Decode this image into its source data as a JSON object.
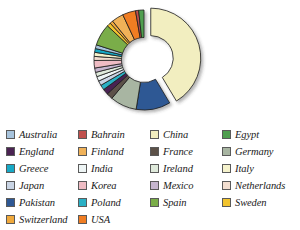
{
  "chart": {
    "title": "",
    "type_label": "exploded-donut"
  },
  "legend": {
    "columns": 4,
    "items": [
      {
        "label": "Australia",
        "color": "#a8c4dd"
      },
      {
        "label": "Bahrain",
        "color": "#c0504d"
      },
      {
        "label": "China",
        "color": "#f2eec0"
      },
      {
        "label": "Egypt",
        "color": "#4f9e4f"
      },
      {
        "label": "England",
        "color": "#4a2352"
      },
      {
        "label": "Finland",
        "color": "#f0b259"
      },
      {
        "label": "France",
        "color": "#5c5148"
      },
      {
        "label": "Germany",
        "color": "#a8b5a2"
      },
      {
        "label": "Greece",
        "color": "#17a9c6"
      },
      {
        "label": "India",
        "color": "#eef5f5"
      },
      {
        "label": "Ireland",
        "color": "#dfeadb"
      },
      {
        "label": "Italy",
        "color": "#f5f2cc"
      },
      {
        "label": "Japan",
        "color": "#c9d4e4"
      },
      {
        "label": "Korea",
        "color": "#efbcc4"
      },
      {
        "label": "Mexico",
        "color": "#c6b6cf"
      },
      {
        "label": "Netherlands",
        "color": "#f2ded0"
      },
      {
        "label": "Pakistan",
        "color": "#2e5894"
      },
      {
        "label": "Poland",
        "color": "#2ab0c5"
      },
      {
        "label": "Spain",
        "color": "#7aad48"
      },
      {
        "label": "Sweden",
        "color": "#f2c42e"
      },
      {
        "label": "Switzerland",
        "color": "#f0a93c"
      },
      {
        "label": "USA",
        "color": "#f07d23"
      }
    ]
  },
  "chart_data": {
    "type": "pie",
    "title": "",
    "xlabel": "",
    "ylabel": "",
    "legend_position": "bottom",
    "grid": false,
    "exploded_slice": "China",
    "start_angle_deg": 0,
    "donut_hole_ratio": 0.45,
    "categories": [
      "China",
      "Pakistan",
      "Germany",
      "France",
      "England",
      "Poland",
      "Japan",
      "India",
      "Ireland",
      "Mexico",
      "Korea",
      "Netherlands",
      "Italy",
      "Greece",
      "Australia",
      "Spain",
      "Sweden",
      "Switzerland",
      "Finland",
      "USA",
      "Bahrain",
      "Egypt"
    ],
    "values": [
      41.0,
      11.0,
      8.5,
      2.0,
      1.8,
      1.6,
      1.5,
      1.5,
      1.4,
      1.4,
      2.4,
      1.3,
      1.3,
      1.2,
      1.2,
      7.0,
      1.2,
      1.0,
      3.8,
      4.2,
      1.0,
      1.7
    ],
    "unit": "percent"
  }
}
